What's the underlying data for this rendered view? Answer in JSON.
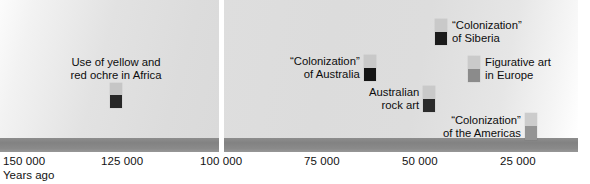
{
  "axis": {
    "title": "Years ago",
    "ticks_left": [
      {
        "label": "150 000",
        "x": 3
      },
      {
        "label": "125 000",
        "x": 101
      },
      {
        "label": "100 000",
        "x": 200
      }
    ],
    "ticks_right": [
      {
        "label": "75 000",
        "x": 304
      },
      {
        "label": "50 000",
        "x": 402
      },
      {
        "label": "25 000",
        "x": 500
      }
    ],
    "bar_color": "#878787",
    "break_note": "axis break between 100 000 and 100 000"
  },
  "events": [
    {
      "id": "ochre-africa",
      "label_line1": "Use of yellow and",
      "label_line2": "red ochre in Africa",
      "label_position": "above",
      "marker": {
        "top_color": "#c6c6c6",
        "bottom_color": "#272727",
        "top_h": 12,
        "bottom_h": 13
      },
      "x": 110,
      "y": 56
    },
    {
      "id": "colonization-siberia",
      "label_line1": "“Colonization”",
      "label_line2": "of Siberia",
      "label_position": "right",
      "marker": {
        "top_color": "#c9c9c9",
        "bottom_color": "#1b1b1b",
        "top_h": 13,
        "bottom_h": 13
      },
      "x": 435,
      "y": 19
    },
    {
      "id": "colonization-australia",
      "label_line1": "“Colonization”",
      "label_line2": "of Australia",
      "label_position": "left",
      "marker": {
        "top_color": "#c8c8c8",
        "bottom_color": "#141414",
        "top_h": 13,
        "bottom_h": 13
      },
      "x": 364,
      "y": 55
    },
    {
      "id": "figurative-art-europe",
      "label_line1": "Figurative art",
      "label_line2": "in Europe",
      "label_position": "right",
      "marker": {
        "top_color": "#cacaca",
        "bottom_color": "#8b8b8b",
        "top_h": 13,
        "bottom_h": 13
      },
      "x": 468,
      "y": 56
    },
    {
      "id": "australian-rock-art",
      "label_line1": "Australian",
      "label_line2": "rock art",
      "label_position": "left",
      "marker": {
        "top_color": "#c9c9c9",
        "bottom_color": "#2b2b2b",
        "top_h": 13,
        "bottom_h": 13
      },
      "x": 423,
      "y": 86
    },
    {
      "id": "colonization-americas",
      "label_line1": "“Colonization”",
      "label_line2": "of the Americas",
      "label_position": "left",
      "marker": {
        "top_color": "#cccccc",
        "bottom_color": "#949494",
        "top_h": 13,
        "bottom_h": 14
      },
      "x": 525,
      "y": 113
    }
  ],
  "chart_data": {
    "type": "timeline",
    "title": "",
    "xlabel": "Years ago",
    "ylabel": "",
    "axis_direction": "decreasing",
    "broken_axis": true,
    "panels": [
      {
        "name": "left",
        "x_range": [
          155000,
          98000
        ],
        "tick_values": [
          150000,
          125000,
          100000
        ]
      },
      {
        "name": "right",
        "x_range": [
          100000,
          15000
        ],
        "tick_values": [
          75000,
          50000,
          25000
        ]
      }
    ],
    "categories": [
      "Use of yellow and red ochre in Africa",
      "“Colonization” of Australia",
      "“Colonization” of Siberia",
      "Australian rock art",
      "Figurative art in Europe",
      "“Colonization” of the Americas"
    ],
    "values": [
      123000,
      60000,
      35000,
      45000,
      30000,
      15000
    ],
    "points": [
      {
        "label": "Use of yellow and red ochre in Africa",
        "years_ago": 123000,
        "panel": "left",
        "marker_style": "light-over-dark"
      },
      {
        "label": "“Colonization” of Australia",
        "years_ago": 60000,
        "panel": "right",
        "marker_style": "light-over-black"
      },
      {
        "label": "“Colonization” of Siberia",
        "years_ago": 35000,
        "panel": "right",
        "marker_style": "light-over-black"
      },
      {
        "label": "Australian rock art",
        "years_ago": 45000,
        "panel": "right",
        "marker_style": "light-over-dark"
      },
      {
        "label": "Figurative art in Europe",
        "years_ago": 30000,
        "panel": "right",
        "marker_style": "light-over-gray"
      },
      {
        "label": "“Colonization” of the Americas",
        "years_ago": 15000,
        "panel": "right",
        "marker_style": "light-over-gray"
      }
    ],
    "grid": false,
    "legend": "none"
  }
}
